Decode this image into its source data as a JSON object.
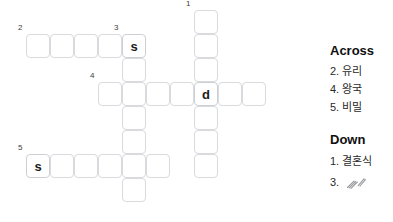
{
  "grid": {
    "cell_size": 24,
    "cell_pitch": 24,
    "origin_x": 26,
    "origin_y": 10,
    "entries": [
      {
        "number": "1",
        "direction": "down",
        "start_col": 7,
        "start_row": 0,
        "length": 7,
        "letters": [
          "",
          "",
          "",
          "d",
          "",
          "",
          ""
        ]
      },
      {
        "number": "2",
        "direction": "across",
        "start_col": 0,
        "start_row": 1,
        "length": 5,
        "letters": [
          "",
          "",
          "",
          "",
          "s"
        ]
      },
      {
        "number": "3",
        "direction": "down",
        "start_col": 4,
        "start_row": 1,
        "length": 7,
        "letters": [
          "s",
          "",
          "",
          "",
          "",
          "",
          ""
        ]
      },
      {
        "number": "4",
        "direction": "across",
        "start_col": 3,
        "start_row": 3,
        "length": 7,
        "letters": [
          "",
          "",
          "",
          "",
          "d",
          "",
          ""
        ]
      },
      {
        "number": "5",
        "direction": "across",
        "start_col": 0,
        "start_row": 6,
        "length": 6,
        "letters": [
          "s",
          "",
          "",
          "",
          "",
          ""
        ]
      }
    ],
    "cells": [
      {
        "col": 7,
        "row": 0,
        "letter": "",
        "number": "1"
      },
      {
        "col": 0,
        "row": 1,
        "letter": "",
        "number": "2"
      },
      {
        "col": 1,
        "row": 1,
        "letter": ""
      },
      {
        "col": 2,
        "row": 1,
        "letter": ""
      },
      {
        "col": 3,
        "row": 1,
        "letter": ""
      },
      {
        "col": 4,
        "row": 1,
        "letter": "s",
        "number": "3"
      },
      {
        "col": 7,
        "row": 1,
        "letter": ""
      },
      {
        "col": 4,
        "row": 2,
        "letter": ""
      },
      {
        "col": 7,
        "row": 2,
        "letter": ""
      },
      {
        "col": 3,
        "row": 3,
        "letter": "",
        "number": "4"
      },
      {
        "col": 4,
        "row": 3,
        "letter": ""
      },
      {
        "col": 5,
        "row": 3,
        "letter": ""
      },
      {
        "col": 6,
        "row": 3,
        "letter": ""
      },
      {
        "col": 7,
        "row": 3,
        "letter": "d"
      },
      {
        "col": 8,
        "row": 3,
        "letter": ""
      },
      {
        "col": 9,
        "row": 3,
        "letter": ""
      },
      {
        "col": 4,
        "row": 4,
        "letter": ""
      },
      {
        "col": 7,
        "row": 4,
        "letter": ""
      },
      {
        "col": 4,
        "row": 5,
        "letter": ""
      },
      {
        "col": 7,
        "row": 5,
        "letter": ""
      },
      {
        "col": 0,
        "row": 6,
        "letter": "s",
        "number": "5"
      },
      {
        "col": 1,
        "row": 6,
        "letter": ""
      },
      {
        "col": 2,
        "row": 6,
        "letter": ""
      },
      {
        "col": 3,
        "row": 6,
        "letter": ""
      },
      {
        "col": 4,
        "row": 6,
        "letter": ""
      },
      {
        "col": 5,
        "row": 6,
        "letter": ""
      },
      {
        "col": 7,
        "row": 6,
        "letter": ""
      },
      {
        "col": 4,
        "row": 7,
        "letter": ""
      }
    ]
  },
  "clues": {
    "across": {
      "heading": "Across",
      "items": [
        {
          "number": "2.",
          "text": "유리"
        },
        {
          "number": "4.",
          "text": "왕국"
        },
        {
          "number": "5.",
          "text": "비밀"
        }
      ]
    },
    "down": {
      "heading": "Down",
      "items": [
        {
          "number": "1.",
          "text": "결혼식"
        },
        {
          "number": "3.",
          "text": ""
        }
      ]
    }
  },
  "colors": {
    "background": "#ffffff",
    "cell_border": "#d8dadd",
    "letter_text": "#1b1b1b",
    "clue_number": "#3c3c3c",
    "heading_text": "#0f0f0f",
    "clue_text": "#2a2a2a"
  }
}
